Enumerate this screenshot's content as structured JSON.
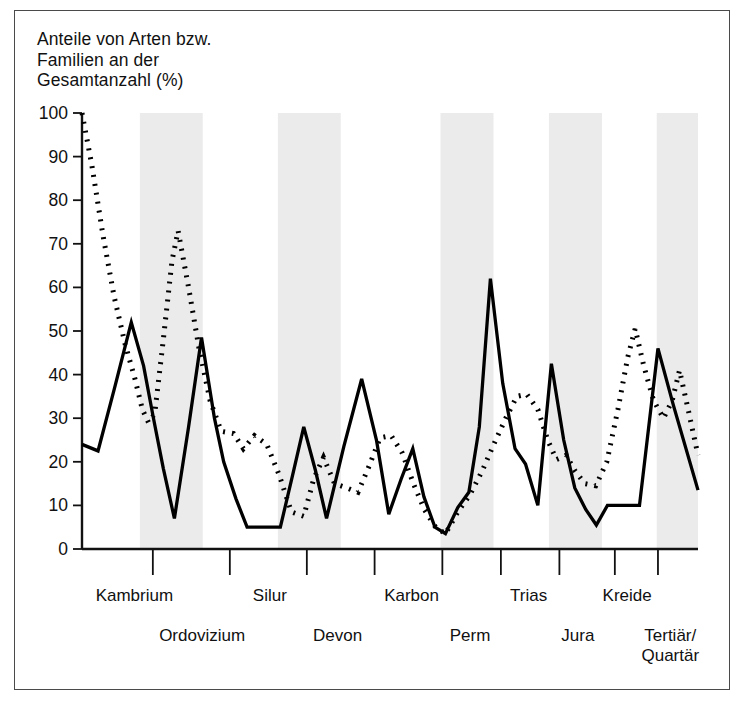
{
  "figure": {
    "title": "Anteile von Arten bzw.\nFamilien an der\nGesamtanzahl (%)",
    "frame_color": "#4a4a4a",
    "background": "#ffffff",
    "band_color": "#ebebeb"
  },
  "chart_data": {
    "type": "line",
    "title": "Anteile von Arten bzw. Familien an der Gesamtanzahl (%)",
    "xlabel": "",
    "ylabel": "Anteile von Arten bzw. Familien an der Gesamtanzahl (%)",
    "ylim": [
      0,
      100
    ],
    "yticks": [
      0,
      10,
      20,
      30,
      40,
      50,
      60,
      70,
      80,
      90,
      100
    ],
    "ytick_labels": [
      "0",
      "10",
      "20",
      "30",
      "40",
      "50",
      "60",
      "70",
      "80",
      "90",
      "100"
    ],
    "grid": false,
    "legend": "none",
    "xlim": [
      0,
      100
    ],
    "periods_upper": [
      {
        "label": "Kambrium",
        "x": 8.5
      },
      {
        "label": "Silur",
        "x": 30.5
      },
      {
        "label": "Karbon",
        "x": 53.5
      },
      {
        "label": "Trias",
        "x": 72.5
      },
      {
        "label": "Kreide",
        "x": 88.5
      }
    ],
    "periods_lower": [
      {
        "label": "Ordovizium",
        "x": 19.5
      },
      {
        "label": "Devon",
        "x": 41.5
      },
      {
        "label": "Perm",
        "x": 63.0
      },
      {
        "label": "Jura",
        "x": 80.5
      },
      {
        "label": "Tertiär/\nQuartär",
        "x": 95.5
      }
    ],
    "period_ticks": [
      11.5,
      24.0,
      36.5,
      47.5,
      58.5,
      68.0,
      77.5,
      86.5,
      93.5
    ],
    "shaded_bands": [
      {
        "x0": 9.4,
        "x1": 19.6
      },
      {
        "x0": 31.8,
        "x1": 42.0
      },
      {
        "x0": 58.2,
        "x1": 66.8
      },
      {
        "x0": 75.8,
        "x1": 84.4
      },
      {
        "x0": 93.3,
        "x1": 100.0
      }
    ],
    "series": [
      {
        "name": "Arten",
        "style": "solid",
        "color": "#000000",
        "points": [
          [
            0.0,
            24.0
          ],
          [
            2.6,
            22.5
          ],
          [
            5.3,
            37.0
          ],
          [
            8.0,
            52.0
          ],
          [
            10.0,
            42.0
          ],
          [
            11.6,
            30.0
          ],
          [
            13.2,
            18.5
          ],
          [
            15.0,
            7.0
          ],
          [
            17.3,
            28.0
          ],
          [
            19.4,
            48.5
          ],
          [
            21.5,
            30.0
          ],
          [
            23.0,
            20.0
          ],
          [
            25.0,
            11.5
          ],
          [
            26.8,
            5.0
          ],
          [
            30.0,
            5.0
          ],
          [
            32.2,
            5.0
          ],
          [
            34.2,
            17.0
          ],
          [
            36.0,
            28.0
          ],
          [
            37.9,
            18.0
          ],
          [
            39.7,
            7.0
          ],
          [
            42.5,
            23.5
          ],
          [
            45.4,
            39.0
          ],
          [
            47.8,
            25.0
          ],
          [
            49.8,
            8.0
          ],
          [
            51.8,
            16.0
          ],
          [
            53.7,
            23.0
          ],
          [
            55.5,
            12.0
          ],
          [
            57.3,
            5.0
          ],
          [
            59.0,
            3.5
          ],
          [
            61.0,
            9.5
          ],
          [
            62.8,
            13.0
          ],
          [
            64.5,
            28.0
          ],
          [
            66.3,
            62.0
          ],
          [
            68.3,
            38.0
          ],
          [
            70.3,
            23.0
          ],
          [
            72.0,
            19.5
          ],
          [
            74.0,
            10.0
          ],
          [
            76.2,
            42.5
          ],
          [
            78.2,
            25.0
          ],
          [
            80.0,
            14.0
          ],
          [
            81.8,
            9.0
          ],
          [
            83.5,
            5.5
          ],
          [
            85.3,
            10.0
          ],
          [
            88.5,
            10.0
          ],
          [
            90.5,
            10.0
          ],
          [
            93.5,
            46.0
          ],
          [
            96.0,
            33.0
          ],
          [
            100.0,
            13.5
          ]
        ]
      },
      {
        "name": "Familien",
        "style": "dotted",
        "color": "#000000",
        "points": [
          [
            0.0,
            100.0
          ],
          [
            1.6,
            88.0
          ],
          [
            3.4,
            72.0
          ],
          [
            5.2,
            58.0
          ],
          [
            7.0,
            47.0
          ],
          [
            8.6,
            39.0
          ],
          [
            9.8,
            32.0
          ],
          [
            10.8,
            29.0
          ],
          [
            11.8,
            31.0
          ],
          [
            13.2,
            48.0
          ],
          [
            14.6,
            66.0
          ],
          [
            15.6,
            73.0
          ],
          [
            17.3,
            60.0
          ],
          [
            19.0,
            46.0
          ],
          [
            20.8,
            34.0
          ],
          [
            22.6,
            27.0
          ],
          [
            24.6,
            26.5
          ],
          [
            26.2,
            23.0
          ],
          [
            28.0,
            26.0
          ],
          [
            30.0,
            24.0
          ],
          [
            32.0,
            17.0
          ],
          [
            34.0,
            8.5
          ],
          [
            36.0,
            7.5
          ],
          [
            37.6,
            16.0
          ],
          [
            39.2,
            21.0
          ],
          [
            41.0,
            15.0
          ],
          [
            43.0,
            14.0
          ],
          [
            44.8,
            13.0
          ],
          [
            46.6,
            19.0
          ],
          [
            48.4,
            25.5
          ],
          [
            50.2,
            26.0
          ],
          [
            52.0,
            22.0
          ],
          [
            53.8,
            15.0
          ],
          [
            55.6,
            9.0
          ],
          [
            57.4,
            5.0
          ],
          [
            59.0,
            3.5
          ],
          [
            61.0,
            8.5
          ],
          [
            63.0,
            12.5
          ],
          [
            65.0,
            18.0
          ],
          [
            67.0,
            24.5
          ],
          [
            68.8,
            30.0
          ],
          [
            70.6,
            35.0
          ],
          [
            72.2,
            35.5
          ],
          [
            74.0,
            32.0
          ],
          [
            75.6,
            25.0
          ],
          [
            77.0,
            20.5
          ],
          [
            78.6,
            21.5
          ],
          [
            80.0,
            18.0
          ],
          [
            81.6,
            15.0
          ],
          [
            83.4,
            14.5
          ],
          [
            85.2,
            20.0
          ],
          [
            87.0,
            32.0
          ],
          [
            88.6,
            44.0
          ],
          [
            89.8,
            50.5
          ],
          [
            91.2,
            42.0
          ],
          [
            92.8,
            34.0
          ],
          [
            94.4,
            30.0
          ],
          [
            95.8,
            34.0
          ],
          [
            97.0,
            41.0
          ],
          [
            98.4,
            32.0
          ],
          [
            100.0,
            21.5
          ]
        ]
      }
    ]
  }
}
